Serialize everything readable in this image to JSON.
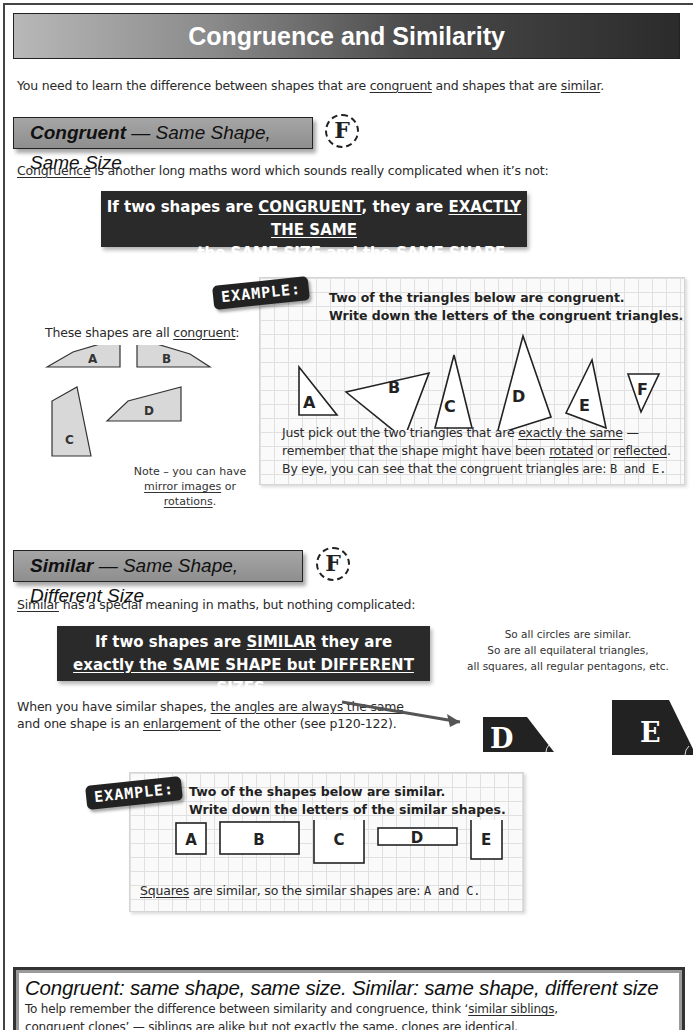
{
  "title": "Congruence and Similarity",
  "intro": {
    "before": "You need to learn the difference between shapes that are ",
    "term1": "congruent",
    "middle": " and shapes that are ",
    "term2": "similar",
    "after": "."
  },
  "congruent_section": {
    "heading_bold": "Congruent",
    "heading_rest": " — Same Shape, Same Size",
    "badge": "F",
    "desc_term": "Congruence",
    "desc_rest": " is another long maths word which sounds really complicated when it’s not:",
    "rule_line1_a": "If two shapes are ",
    "rule_line1_b": "CONGRUENT",
    "rule_line1_c": ", they are ",
    "rule_line1_d": "EXACTLY THE SAME",
    "rule_line2_a": "— ",
    "rule_line2_b": "the SAME SIZE and the SAME SHAPE",
    "rule_line2_c": ".",
    "shapes_caption_a": "These shapes are all ",
    "shapes_caption_b": "congruent",
    "shapes_caption_c": ":",
    "shape_labels": [
      "A",
      "B",
      "C",
      "D"
    ],
    "note_line1": "Note – you can have",
    "note_mirror": "mirror images",
    "note_or": " or ",
    "note_rotations": "rotations",
    "note_end": ".",
    "example": {
      "tag": "EXAMPLE:",
      "question_line1": "Two of the triangles below are congruent.",
      "question_line2": "Write down the letters of the congruent triangles.",
      "triangle_labels": [
        "A",
        "B",
        "C",
        "D",
        "E",
        "F"
      ],
      "answer_line1_a": "Just pick out the two triangles that are ",
      "answer_line1_b": "exactly the same",
      "answer_line1_c": " —",
      "answer_line2_a": "remember that the shape might have been ",
      "answer_line2_b": "rotated",
      "answer_line2_c": " or ",
      "answer_line2_d": "reflected",
      "answer_line2_e": ".",
      "answer_line3": "By eye, you can see that the congruent triangles are: ",
      "answer_value": "B and E."
    }
  },
  "similar_section": {
    "heading_bold": "Similar",
    "heading_rest": " — Same Shape, Different Size",
    "badge": "F",
    "desc_term": "Similar",
    "desc_rest": " has a special meaning in maths, but nothing complicated:",
    "rule_line1_a": "If two shapes are ",
    "rule_line1_b": "SIMILAR",
    "rule_line1_c": " they are",
    "rule_line2": "exactly the SAME SHAPE but DIFFERENT SIZES",
    "rule_line2_end": ".",
    "side_note": [
      "So all circles are similar.",
      "So are all equilateral triangles,",
      "all squares, all regular pentagons, etc."
    ],
    "angles_line1_a": "When you have similar shapes, ",
    "angles_line1_b": "the angles are always the same",
    "angles_line2_a": "and one shape is an ",
    "angles_line2_b": "enlargement",
    "angles_line2_c": " of the other (see p120-122).",
    "shape_labels": [
      "D",
      "E"
    ],
    "example": {
      "tag": "EXAMPLE:",
      "question_line1": "Two of the shapes below are similar.",
      "question_line2": "Write down the letters of the similar shapes.",
      "rect_labels": [
        "A",
        "B",
        "C",
        "D",
        "E"
      ],
      "answer_term": "Squares",
      "answer_rest": " are similar, so the similar shapes are: ",
      "answer_value": "A and C."
    }
  },
  "summary": {
    "title": "Congruent: same shape, same size.  Similar: same shape, different size",
    "line1_a": "To help remember the difference between similarity and congruence, think ‘",
    "line1_b": "similar siblings",
    "line1_c": ",",
    "line2_a": "congruent clones",
    "line2_b": "’ — siblings are alike but not exactly the same, clones are identical."
  }
}
